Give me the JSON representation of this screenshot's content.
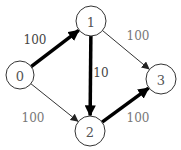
{
  "diagram": {
    "type": "directed-weighted-graph",
    "nodes": [
      {
        "id": "0",
        "label": "0",
        "x": 20,
        "y": 75,
        "r": 14
      },
      {
        "id": "1",
        "label": "1",
        "x": 91,
        "y": 21,
        "r": 15
      },
      {
        "id": "2",
        "label": "2",
        "x": 90,
        "y": 131,
        "r": 15
      },
      {
        "id": "3",
        "label": "3",
        "x": 161,
        "y": 79,
        "r": 15
      }
    ],
    "edges": [
      {
        "from": "0",
        "to": "1",
        "weight": "100",
        "style": "thick",
        "label_x": 35,
        "label_y": 40,
        "label_tone": "dark"
      },
      {
        "from": "1",
        "to": "2",
        "weight": "10",
        "style": "thick",
        "label_x": 101,
        "label_y": 73,
        "label_tone": "dark"
      },
      {
        "from": "2",
        "to": "3",
        "weight": "100",
        "style": "thick",
        "label_x": 138,
        "label_y": 118,
        "label_tone": "light"
      },
      {
        "from": "0",
        "to": "2",
        "weight": "100",
        "style": "thin",
        "label_x": 33,
        "label_y": 118,
        "label_tone": "light"
      },
      {
        "from": "1",
        "to": "3",
        "weight": "100",
        "style": "thin",
        "label_x": 138,
        "label_y": 36,
        "label_tone": "light"
      }
    ],
    "colors": {
      "thick_edge": "#000000",
      "thin_edge": "#333333",
      "node_stroke": "#333333",
      "label_dark": "#444444",
      "label_light": "#777777"
    }
  }
}
